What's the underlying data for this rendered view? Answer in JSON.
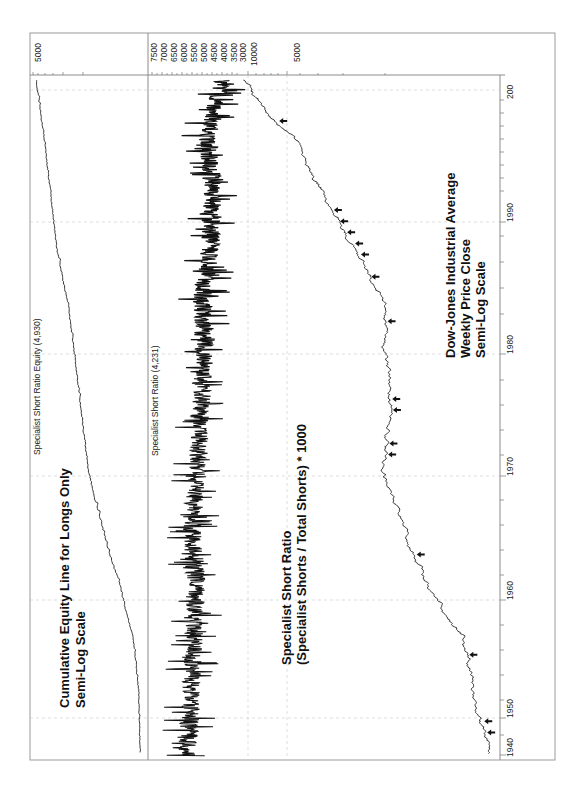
{
  "chart_data": [
    {
      "type": "line",
      "panel": "equity",
      "title": "Specialist Short Ratio Equity (4,930)",
      "annotation": [
        "Cumulative Equity Line for Longs Only",
        "Semi-Log Scale"
      ],
      "value_axis_labels": [
        "5000"
      ],
      "scale": "log",
      "x": [
        1940,
        1945,
        1950,
        1955,
        1960,
        1965,
        1970,
        1975,
        1980,
        1985,
        1990,
        1995,
        2000
      ],
      "values": [
        100,
        105,
        130,
        220,
        420,
        700,
        900,
        1150,
        1500,
        2300,
        2900,
        3700,
        4930
      ],
      "final_value": 4930
    },
    {
      "type": "line",
      "panel": "specialist_short_ratio",
      "title": "Specialist Short Ratio (4,231)",
      "annotation": [
        "Specialist Short Ratio",
        "(Specialist Shorts / Total Shorts) * 1000"
      ],
      "value_axis_labels": [
        "7500",
        "7000",
        "6500",
        "6000",
        "5500",
        "5000",
        "4500",
        "4000",
        "3500",
        "3000"
      ],
      "scale": "linear",
      "x": [
        1940,
        1945,
        1950,
        1955,
        1960,
        1965,
        1970,
        1975,
        1980,
        1985,
        1990,
        1995,
        2000
      ],
      "values": [
        5800,
        5600,
        5500,
        5400,
        5600,
        5300,
        5200,
        5000,
        5100,
        4700,
        4600,
        4800,
        4231
      ],
      "final_value": 4231
    },
    {
      "type": "line",
      "panel": "djia",
      "title": "",
      "annotation": [
        "Dow-Jones Industrial Average",
        "Weekly Price Close",
        "Semi-Log Scale"
      ],
      "value_axis_labels": [
        "10000",
        "5000"
      ],
      "scale": "log",
      "x": [
        1940,
        1945,
        1950,
        1955,
        1960,
        1965,
        1970,
        1975,
        1980,
        1985,
        1990,
        1995,
        2000
      ],
      "values": [
        140,
        180,
        220,
        420,
        650,
        900,
        800,
        850,
        900,
        1500,
        2700,
        4500,
        10500
      ],
      "buy_signal_markers": [
        1941,
        1942,
        1948,
        1957,
        1966,
        1967,
        1970,
        1971,
        1978,
        1982,
        1984,
        1985,
        1986,
        1987,
        1988,
        1996
      ]
    }
  ],
  "time_axis": {
    "labels": [
      "1940",
      "1950",
      "1960",
      "1970",
      "1980",
      "1990",
      "200"
    ],
    "range": [
      1939,
      2000
    ]
  },
  "orientation": "rotated 90 degrees clockwise"
}
